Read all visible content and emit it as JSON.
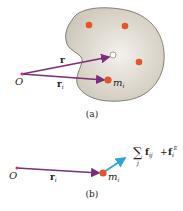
{
  "figure_a": {
    "origin_label": "O",
    "r_label": "r",
    "ri_label": "r",
    "ri_sub": "i",
    "mass_label": "m",
    "mass_sub": "i",
    "caption": "(a)",
    "colors": {
      "body_fill": "#d9d3c8",
      "body_stroke": "#6b655c",
      "particle": "#e8542a",
      "vector": "#7a2d7a",
      "origin": "#d6336c"
    }
  },
  "figure_b": {
    "origin_label": "O",
    "ri_label": "r",
    "ri_sub": "i",
    "mass_label": "m",
    "mass_sub": "i",
    "sum_symbol": "∑",
    "sum_index": "j",
    "force_label": "f",
    "force_sub": "ij",
    "plus": "+",
    "ext_force_label": "f",
    "ext_force_sub": "i",
    "ext_force_sup": "E",
    "caption": "(b)",
    "colors": {
      "force_vector": "#2aa6d9"
    }
  }
}
